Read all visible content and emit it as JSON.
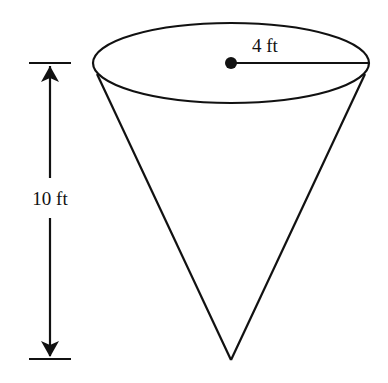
{
  "diagram": {
    "shape": "inverted cone",
    "radius_label": "4 ft",
    "height_label": "10 ft",
    "colors": {
      "stroke": "#111111",
      "background": "#ffffff"
    }
  }
}
